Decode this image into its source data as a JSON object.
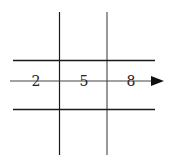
{
  "diagram": {
    "labels": [
      "2",
      "5",
      "8"
    ],
    "colors": {
      "grid_line": "#1a1a1a",
      "grid_line_right": "#555555",
      "arrow": "#111111",
      "label": "#222222",
      "background": "#ffffff"
    }
  }
}
